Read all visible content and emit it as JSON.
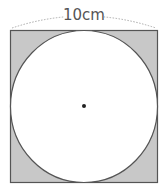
{
  "figure": {
    "dimension_label": "10cm",
    "shape_outer": "square",
    "shape_inner": "circle",
    "center_marker": "dot",
    "colors": {
      "shaded": "#c8c8c8",
      "stroke": "#555555",
      "circle_fill": "#ffffff",
      "dashed": "#aaaaaa",
      "label": "#555555"
    }
  }
}
